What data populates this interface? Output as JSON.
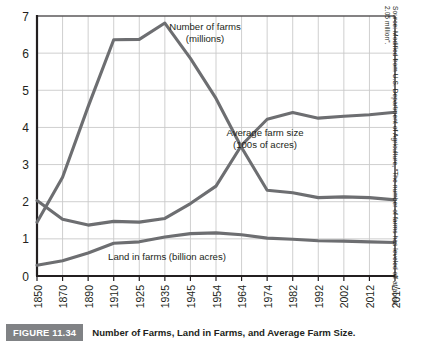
{
  "figure": {
    "tag": "FIGURE 11.34",
    "caption": "Number of Farms, Land in Farms, and Average Farm Size.",
    "source": "Source: Modified from U.S. Department of Agriculture, “The number of farms has leveled off at about 2.05 million”."
  },
  "chart_data": {
    "type": "line",
    "title": "",
    "xlabel": "",
    "ylabel": "",
    "ylim": [
      0,
      7
    ],
    "yticks": [
      "0",
      "1",
      "2",
      "3",
      "4",
      "5",
      "6",
      "7"
    ],
    "grid": true,
    "legend_position": "inline-annotations",
    "categories": [
      "1850",
      "1870",
      "1890",
      "1910",
      "1925",
      "1935",
      "1945",
      "1954",
      "1964",
      "1974",
      "1982",
      "1992",
      "2002",
      "2012",
      "2017"
    ],
    "series": [
      {
        "name": "Number of farms (millions)",
        "color": "#6d6e71",
        "values": [
          1.45,
          2.66,
          4.56,
          6.36,
          6.37,
          6.81,
          5.86,
          4.78,
          3.46,
          2.31,
          2.24,
          2.11,
          2.13,
          2.11,
          2.05
        ]
      },
      {
        "name": "Average farm size (100s of acres)",
        "color": "#6d6e71",
        "values": [
          2.03,
          1.53,
          1.37,
          1.47,
          1.45,
          1.55,
          1.95,
          2.42,
          3.52,
          4.22,
          4.4,
          4.25,
          4.3,
          4.34,
          4.41
        ]
      },
      {
        "name": "Land in farms (billion acres)",
        "color": "#6d6e71",
        "values": [
          0.29,
          0.41,
          0.62,
          0.88,
          0.92,
          1.05,
          1.14,
          1.16,
          1.11,
          1.02,
          0.99,
          0.95,
          0.94,
          0.92,
          0.9
        ]
      }
    ],
    "annotations": [
      {
        "name": "number-of-farms",
        "lines": [
          "Number of farms",
          "(millions)"
        ],
        "x": 205,
        "y": 30
      },
      {
        "name": "average-farm-size",
        "lines": [
          "Average farm size",
          "(100s of acres)"
        ],
        "x": 265,
        "y": 136
      },
      {
        "name": "land-in-farms",
        "lines": [
          "Land in farms (billion acres)"
        ],
        "x": 167,
        "y": 260
      }
    ]
  }
}
